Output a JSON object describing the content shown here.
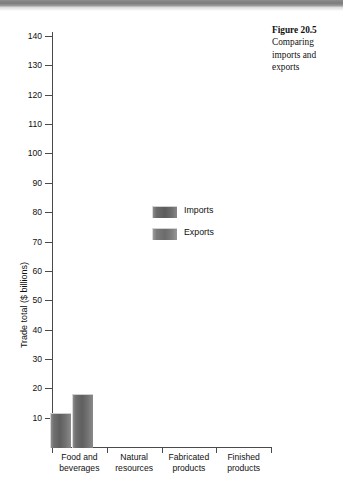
{
  "caption": {
    "figure_number": "Figure 20.5",
    "description": "Comparing imports and exports"
  },
  "chart_data": {
    "type": "bar",
    "title": "",
    "xlabel": "",
    "ylabel": "Trade total ($ billions)",
    "categories": [
      "Food and beverages",
      "Natural resources",
      "Fabricated products",
      "Finished products"
    ],
    "series": [
      {
        "name": "Imports",
        "values": [
          11.5,
          null,
          null,
          null
        ],
        "color": "#5f5f5f"
      },
      {
        "name": "Exports",
        "values": [
          18,
          null,
          null,
          null
        ],
        "color": "#6c6c6c"
      }
    ],
    "ylim": [
      0,
      140
    ],
    "yticks": [
      10,
      20,
      30,
      40,
      50,
      60,
      70,
      80,
      90,
      100,
      110,
      120,
      130,
      140
    ],
    "ytick_labels": [
      "10",
      "20",
      "30",
      "40",
      "50",
      "60",
      "70",
      "80",
      "90",
      "100",
      "110",
      "120",
      "130",
      "140"
    ],
    "grid": false,
    "legend_position": "center"
  },
  "legend": {
    "entries": [
      {
        "label": "Imports"
      },
      {
        "label": "Exports"
      }
    ]
  }
}
